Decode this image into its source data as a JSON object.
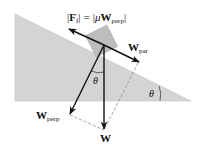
{
  "diagram": {
    "type": "free-body diagram: block on inclined plane with friction",
    "equation": {
      "lhs_bar_open": "|",
      "lhs_symbol": "F",
      "lhs_subscript": "f",
      "lhs_bar_close": "|",
      "equals": "=",
      "rhs_bar_open": "|",
      "rhs_mu": "μ",
      "rhs_symbol": "W",
      "rhs_subscript": "perp",
      "rhs_bar_close": "|"
    },
    "labels": {
      "w_par_symbol": "W",
      "w_par_subscript": "par",
      "w_perp_symbol": "W",
      "w_perp_subscript": "perp",
      "w_symbol": "W",
      "theta_vertex": "θ",
      "theta_incline": "θ"
    },
    "colors": {
      "incline_fill": "#d4d4d4",
      "block_fill": "#bdbdbd",
      "arrow": "#111111",
      "dashed": "#8a8a8a",
      "text": "#111111"
    }
  }
}
